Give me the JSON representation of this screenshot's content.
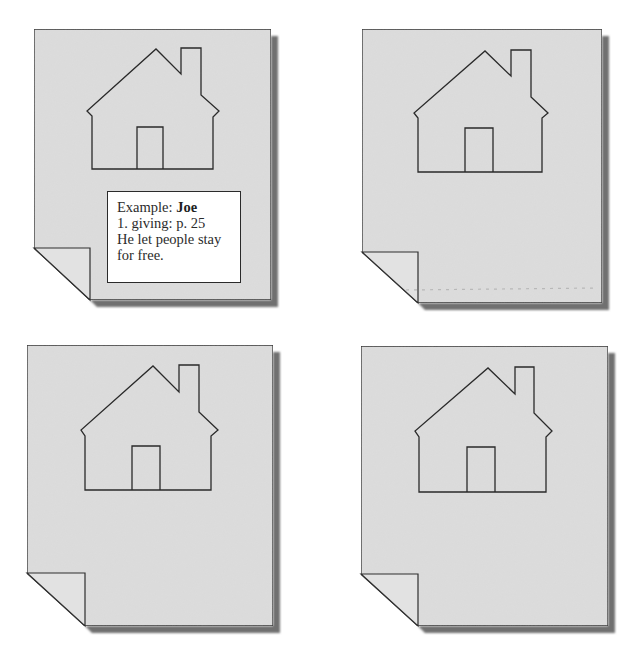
{
  "figure": {
    "colors": {
      "background": "#ffffff",
      "page_fill": "#dddddd",
      "page_stroke": "#2e2e2e",
      "shadow": "#6f6f6f",
      "house_stroke": "#2a2a2a",
      "note_fill": "#ffffff",
      "note_text": "#2b2b2b"
    }
  },
  "pages": [
    {
      "id": "page-1",
      "rect": {
        "left": 34,
        "top": 29,
        "right": 271,
        "bottom": 300
      },
      "fold": {
        "x": 90,
        "y": 248
      },
      "house": {
        "peak": [
          156,
          49
        ],
        "chimney": {
          "left": 181,
          "right": 201,
          "top": 48,
          "left_bottom": 74,
          "right_bottom": 95
        },
        "eave_left": [
          87,
          111
        ],
        "eave_left_inner": [
          92,
          116
        ],
        "eave_right": [
          219,
          111
        ],
        "eave_right_inner": [
          213,
          117
        ],
        "wall_left": 92,
        "wall_right": 213,
        "bottom": 169,
        "door": {
          "left": 137,
          "right": 163,
          "top": 127
        }
      },
      "note": {
        "rect": {
          "left": 107,
          "top": 191,
          "right": 241,
          "bottom": 283
        },
        "line1_prefix": "Example: ",
        "line1_name": "Joe",
        "line2": "1. giving: p. 25",
        "line3": "He let people stay",
        "line4": "for free."
      }
    },
    {
      "id": "page-2",
      "rect": {
        "left": 362,
        "top": 29,
        "right": 602,
        "bottom": 303
      },
      "fold": {
        "x": 418,
        "y": 252
      },
      "house": {
        "peak": [
          485,
          51
        ],
        "chimney": {
          "left": 511,
          "right": 531,
          "top": 50,
          "left_bottom": 76,
          "right_bottom": 97
        },
        "eave_left": [
          414,
          113
        ],
        "eave_left_inner": [
          418,
          118
        ],
        "eave_right": [
          548,
          113
        ],
        "eave_right_inner": [
          542,
          118
        ],
        "wall_left": 418,
        "wall_right": 542,
        "bottom": 172,
        "door": {
          "left": 465,
          "right": 493,
          "top": 128
        }
      },
      "note": null
    },
    {
      "id": "page-3",
      "rect": {
        "left": 27,
        "top": 345,
        "right": 273,
        "bottom": 626
      },
      "fold": {
        "x": 85,
        "y": 573
      },
      "house": {
        "peak": [
          153,
          366
        ],
        "chimney": {
          "left": 179,
          "right": 199,
          "top": 365,
          "left_bottom": 392,
          "right_bottom": 412
        },
        "eave_left": [
          81,
          430
        ],
        "eave_left_inner": [
          85,
          436
        ],
        "eave_right": [
          218,
          430
        ],
        "eave_right_inner": [
          211,
          436
        ],
        "wall_left": 85,
        "wall_right": 211,
        "bottom": 490,
        "door": {
          "left": 132,
          "right": 160,
          "top": 446
        }
      },
      "note": null
    },
    {
      "id": "page-4",
      "rect": {
        "left": 361,
        "top": 346,
        "right": 608,
        "bottom": 626
      },
      "fold": {
        "x": 418,
        "y": 574
      },
      "house": {
        "peak": [
          488,
          368
        ],
        "chimney": {
          "left": 515,
          "right": 534,
          "top": 367,
          "left_bottom": 394,
          "right_bottom": 413
        },
        "eave_left": [
          415,
          431
        ],
        "eave_left_inner": [
          419,
          437
        ],
        "eave_right": [
          552,
          431
        ],
        "eave_right_inner": [
          546,
          437
        ],
        "wall_left": 419,
        "wall_right": 546,
        "bottom": 492,
        "door": {
          "left": 467,
          "right": 495,
          "top": 447
        }
      },
      "note": null
    }
  ]
}
